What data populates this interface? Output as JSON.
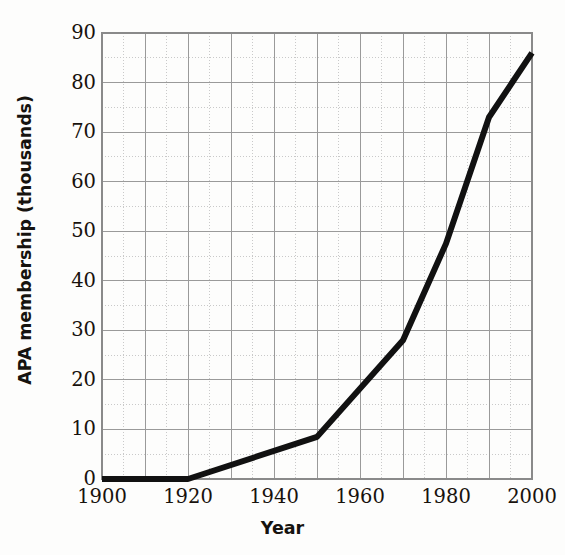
{
  "chart_data": {
    "type": "line",
    "title": "",
    "xlabel": "Year",
    "ylabel": "APA membership (thousands)",
    "xlim": [
      1900,
      2000
    ],
    "ylim": [
      0,
      90
    ],
    "xticks": [
      1900,
      1920,
      1940,
      1960,
      1980,
      2000
    ],
    "xtick_labels": [
      "1900",
      "1920",
      "1940",
      "1960",
      "1980",
      "2000"
    ],
    "yticks": [
      0,
      10,
      20,
      30,
      40,
      50,
      60,
      70,
      80,
      90
    ],
    "ytick_labels": [
      "0",
      "10",
      "20",
      "30",
      "40",
      "50",
      "60",
      "70",
      "80",
      "90"
    ],
    "grid": true,
    "grid_major_x_step": 10,
    "grid_major_y_step": 10,
    "legend": null,
    "legend_position": "none",
    "series": [
      {
        "name": "APA membership",
        "color": "#111111",
        "line_width": 6,
        "x": [
          1900,
          1920,
          1950,
          1970,
          1980,
          1990,
          2000
        ],
        "values": [
          0,
          0,
          8.5,
          28,
          47.5,
          73,
          86
        ]
      }
    ],
    "points": [
      {
        "x": 1900,
        "y": 0
      },
      {
        "x": 1920,
        "y": 0
      },
      {
        "x": 1950,
        "y": 8.5
      },
      {
        "x": 1970,
        "y": 28
      },
      {
        "x": 1980,
        "y": 47.5
      },
      {
        "x": 1990,
        "y": 73
      },
      {
        "x": 2000,
        "y": 86
      }
    ],
    "colors": {
      "line": "#111111",
      "grid": "#9a9a9a",
      "grid_minor": "#c9c9c9",
      "axis": "#8a8a8a",
      "text": "#18120d",
      "background": "#fdfdfc"
    }
  },
  "axes": {
    "y_title": "APA membership (thousands)",
    "x_title": "Year"
  }
}
